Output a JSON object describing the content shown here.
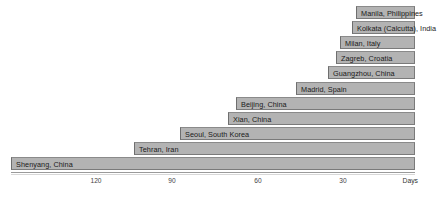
{
  "chart_data": {
    "type": "bar",
    "orientation": "horizontal",
    "title": "",
    "subtitle": "",
    "xlabel": "Days",
    "ylabel": "",
    "xlim": [
      160,
      0
    ],
    "x_reversed": true,
    "grid": false,
    "legend": null,
    "bar_color": "#b3b3b3",
    "bar_border_color": "#7a7a7a",
    "xticks": [
      120,
      90,
      60,
      30
    ],
    "xtick_labels": [
      "120",
      "90",
      "60",
      "30"
    ],
    "categories": [
      "Manila, Philippines",
      "Kolkata (Calcutta), India",
      "Milan, Italy",
      "Zagreb, Croatia",
      "Guangzhou, China",
      "Madrid, Spain",
      "Beijing, China",
      "Xian, China",
      "Seoul, South Korea",
      "Tehran, Iran",
      "Shenyang, China"
    ],
    "values": [
      26,
      26,
      31,
      33,
      36,
      48,
      69,
      72,
      89,
      105,
      148
    ],
    "bars": [
      {
        "label": "Manila, Philippines",
        "value": 26,
        "left_px": 356,
        "width_px": 59,
        "row": 0
      },
      {
        "label": "Kolkata (Calcutta), India",
        "value": 26,
        "left_px": 352,
        "width_px": 63,
        "row": 1
      },
      {
        "label": "Milan, Italy",
        "value": 31,
        "left_px": 340,
        "width_px": 75,
        "row": 2
      },
      {
        "label": "Zagreb, Croatia",
        "value": 33,
        "left_px": 336,
        "width_px": 79,
        "row": 3
      },
      {
        "label": "Guangzhou, China",
        "value": 36,
        "left_px": 328,
        "width_px": 87,
        "row": 4
      },
      {
        "label": "Madrid, Spain",
        "value": 48,
        "left_px": 296,
        "width_px": 119,
        "row": 5
      },
      {
        "label": "Beijing, China",
        "value": 69,
        "left_px": 236,
        "width_px": 179,
        "row": 6
      },
      {
        "label": "Xian, China",
        "value": 72,
        "left_px": 228,
        "width_px": 187,
        "row": 7
      },
      {
        "label": "Seoul, South Korea",
        "value": 89,
        "left_px": 180,
        "width_px": 235,
        "row": 8
      },
      {
        "label": "Tehran, Iran",
        "value": 105,
        "left_px": 134,
        "width_px": 281,
        "row": 9
      },
      {
        "label": "Shenyang, China",
        "value": 148,
        "left_px": 11,
        "width_px": 404,
        "row": 10
      }
    ],
    "tick_positions_px": [
      96,
      172,
      258,
      343
    ],
    "axis_title_x_px": 418
  }
}
